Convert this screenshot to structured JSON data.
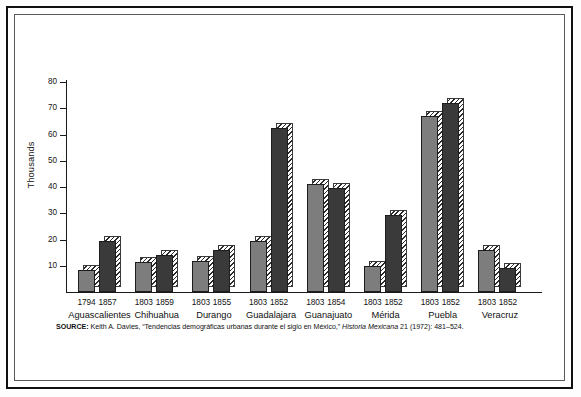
{
  "figure": {
    "y_axis_title": "Thousands",
    "source_prefix": "SOURCE:",
    "source_text": " Keith A. Davies, “Tendencias demográficas urbanas durante el siglo en México,” ",
    "source_journal": "Historia Mexicana",
    "source_suffix": " 21 (1972): 481–524."
  },
  "chart_data": {
    "type": "bar",
    "title": "",
    "xlabel": "",
    "ylabel": "Thousands",
    "ylim": [
      0,
      80
    ],
    "yticks": [
      10,
      20,
      30,
      40,
      50,
      60,
      70,
      80
    ],
    "ytick_labels": [
      "10",
      "20",
      "30",
      "40",
      "50",
      "60",
      "70",
      "80"
    ],
    "grid": false,
    "legend": "none",
    "units": "thousands of inhabitants",
    "categories": [
      "Aguascalientes",
      "Chihuahua",
      "Durango",
      "Guadalajara",
      "Guanajuato",
      "Mérida",
      "Puebla",
      "Veracruz"
    ],
    "groups": [
      {
        "city": "Aguascalientes",
        "bars": [
          {
            "year": "1794",
            "value": 8.5,
            "style": "light"
          },
          {
            "year": "1857",
            "value": 19.5,
            "style": "dark"
          }
        ]
      },
      {
        "city": "Chihuahua",
        "bars": [
          {
            "year": "1803",
            "value": 11.5,
            "style": "light"
          },
          {
            "year": "1859",
            "value": 14.0,
            "style": "dark"
          }
        ]
      },
      {
        "city": "Durango",
        "bars": [
          {
            "year": "1803",
            "value": 12.0,
            "style": "light"
          },
          {
            "year": "1855",
            "value": 16.0,
            "style": "dark"
          }
        ]
      },
      {
        "city": "Guadalajara",
        "bars": [
          {
            "year": "1803",
            "value": 19.5,
            "style": "light"
          },
          {
            "year": "1852",
            "value": 62.5,
            "style": "dark"
          }
        ]
      },
      {
        "city": "Guanajuato",
        "bars": [
          {
            "year": "1803",
            "value": 41.0,
            "style": "light"
          },
          {
            "year": "1854",
            "value": 39.5,
            "style": "dark"
          }
        ]
      },
      {
        "city": "Mérida",
        "bars": [
          {
            "year": "1803",
            "value": 10.0,
            "style": "light"
          },
          {
            "year": "1852",
            "value": 29.5,
            "style": "dark"
          }
        ]
      },
      {
        "city": "Puebla",
        "bars": [
          {
            "year": "1803",
            "value": 67.0,
            "style": "light"
          },
          {
            "year": "1852",
            "value": 72.0,
            "style": "dark"
          }
        ]
      },
      {
        "city": "Veracruz",
        "bars": [
          {
            "year": "1803",
            "value": 16.0,
            "style": "light"
          },
          {
            "year": "1852",
            "value": 9.0,
            "style": "dark"
          }
        ]
      }
    ],
    "colors": {
      "bar_light": "#7d7d7d",
      "bar_dark": "#3a3a3a",
      "axis": "#1a1a1a",
      "text": "#111111",
      "background": "#ffffff"
    }
  }
}
